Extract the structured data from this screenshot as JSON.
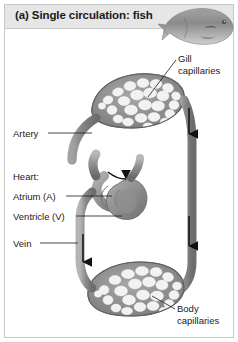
{
  "figure": {
    "panel_letter": "(a)",
    "title": "(a) Single circulation: fish",
    "organism_illustration": "fish-illustration",
    "header_background": "#e6e6e6",
    "border_color": "#c8c8c8",
    "background": "#ffffff",
    "vessel_color": "#8d8d8d",
    "vessel_dark": "#6e6e6e",
    "arrow_color": "#111111",
    "text_color": "#1a1a1a"
  },
  "labels": {
    "gill_capillaries": "Gill\ncapillaries",
    "artery": "Artery",
    "heart": "Heart:",
    "atrium": "Atrium (A)",
    "ventricle": "Ventricle (V)",
    "vein": "Vein",
    "body_capillaries": "Body\ncapillaries"
  },
  "diagram_data": {
    "type": "diagram",
    "circulation_type": "single",
    "circuit_order": [
      "Heart: Atrium (A)",
      "Heart: Ventricle (V)",
      "Artery",
      "Gill capillaries",
      "Body capillaries",
      "Vein"
    ],
    "capillary_beds": [
      {
        "name": "Gill capillaries",
        "position": "top"
      },
      {
        "name": "Body capillaries",
        "position": "bottom"
      }
    ],
    "heart_chambers": [
      {
        "name": "Atrium",
        "abbreviation": "A"
      },
      {
        "name": "Ventricle",
        "abbreviation": "V"
      }
    ],
    "vessels": [
      {
        "name": "Artery",
        "side": "left-upper",
        "flow": "heart-to-gills"
      },
      {
        "name": "Vein",
        "side": "left-lower",
        "flow": "body-to-heart"
      }
    ],
    "flow_arrows": [
      {
        "id": "arrow-right-upper",
        "direction": "down",
        "side": "right"
      },
      {
        "id": "arrow-right-lower",
        "direction": "down",
        "side": "right"
      },
      {
        "id": "arrow-left-vein",
        "direction": "up",
        "side": "left"
      },
      {
        "id": "arrow-heart-in",
        "direction": "into-atrium",
        "side": "center"
      }
    ]
  }
}
